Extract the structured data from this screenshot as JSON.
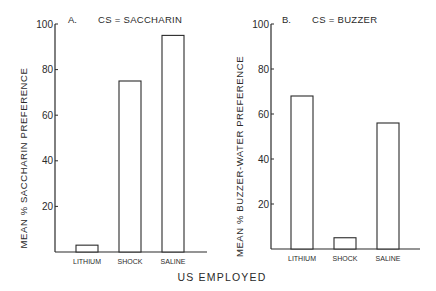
{
  "figure": {
    "x_axis_title": "US EMPLOYED"
  },
  "chart_data": [
    {
      "type": "bar",
      "panel": "A.",
      "title": "CS = SACCHARIN",
      "categories": [
        "LITHIUM",
        "SHOCK",
        "SALINE"
      ],
      "values": [
        3,
        75,
        95
      ],
      "xlabel": "US EMPLOYED",
      "ylabel": "MEAN % SACCHARIN PREFERENCE",
      "ylim": [
        0,
        100
      ],
      "yticks": [
        20,
        40,
        60,
        80,
        100
      ],
      "grid": false,
      "legend": null
    },
    {
      "type": "bar",
      "panel": "B.",
      "title": "CS = BUZZER",
      "categories": [
        "LITHIUM",
        "SHOCK",
        "SALINE"
      ],
      "values": [
        68,
        5,
        56
      ],
      "xlabel": "US EMPLOYED",
      "ylabel": "MEAN % BUZZER-WATER PREFERENCE",
      "ylim": [
        0,
        100
      ],
      "yticks": [
        20,
        40,
        60,
        80,
        100
      ],
      "grid": false,
      "legend": null
    }
  ],
  "colors": {
    "ink": "#2a2a2a",
    "bar_fill": "#ffffff",
    "background": "#ffffff"
  }
}
